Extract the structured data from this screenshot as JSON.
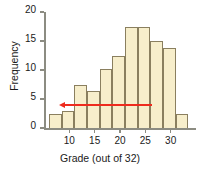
{
  "chart_data": {
    "type": "bar",
    "title": "",
    "xlabel": "Grade (out of 32)",
    "ylabel": "Frequency",
    "xlim": [
      5,
      35
    ],
    "ylim": [
      0,
      20
    ],
    "xticks": [
      10,
      15,
      20,
      25,
      30
    ],
    "yticks": [
      0,
      5,
      10,
      15,
      20
    ],
    "bin_width": 2.5,
    "grid": false,
    "legend": null,
    "bar_color": "#f7eecb",
    "bar_edge_color": "#8a7f5f",
    "axis_color": "#8c8c82",
    "annotation_color": "#ee2b1e",
    "bins": [
      {
        "start": 6.0,
        "end": 8.5,
        "value": 2.5
      },
      {
        "start": 8.5,
        "end": 11.0,
        "value": 3.0
      },
      {
        "start": 11.0,
        "end": 13.5,
        "value": 7.5
      },
      {
        "start": 13.5,
        "end": 16.0,
        "value": 6.3
      },
      {
        "start": 16.0,
        "end": 18.5,
        "value": 10.1
      },
      {
        "start": 18.5,
        "end": 21.0,
        "value": 12.5
      },
      {
        "start": 21.0,
        "end": 23.5,
        "value": 17.5
      },
      {
        "start": 23.5,
        "end": 26.0,
        "value": 17.5
      },
      {
        "start": 26.0,
        "end": 28.5,
        "value": 15.0
      },
      {
        "start": 28.5,
        "end": 31.0,
        "value": 13.8
      },
      {
        "start": 31.0,
        "end": 33.5,
        "value": 2.5
      }
    ],
    "categories": [
      "6-8.5",
      "8.5-11",
      "11-13.5",
      "13.5-16",
      "16-18.5",
      "18.5-21",
      "21-23.5",
      "23.5-26",
      "26-28.5",
      "28.5-31",
      "31-33.5"
    ],
    "values": [
      2.5,
      3.0,
      7.5,
      6.3,
      10.1,
      12.5,
      17.5,
      17.5,
      15.0,
      13.8,
      2.5
    ],
    "annotations": [
      {
        "kind": "arrow",
        "direction": "left",
        "y": 3.9,
        "x_start": 26.3,
        "x_end": 8.9,
        "color": "#ee2b1e"
      }
    ]
  }
}
